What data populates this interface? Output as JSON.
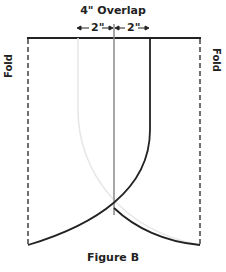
{
  "diagram": {
    "title": "4\" Overlap",
    "dimension_left": "2\"",
    "dimension_right": "2\"",
    "fold_left_label": "Fold",
    "fold_right_label": "Fold",
    "caption": "Figure B",
    "colors": {
      "outline": "#222222",
      "center_line": "#8a8a8a",
      "faint_curve": "#e6e6e6"
    }
  }
}
